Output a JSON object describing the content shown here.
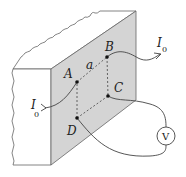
{
  "diagram": {
    "colors": {
      "face": "#d4d4d4",
      "line": "#555555",
      "background": "#ffffff"
    },
    "points": [
      {
        "label": "A",
        "x": 77,
        "y": 82
      },
      {
        "label": "B",
        "x": 107,
        "y": 57
      },
      {
        "label": "C",
        "x": 108,
        "y": 96
      },
      {
        "label": "D",
        "x": 77,
        "y": 118
      }
    ],
    "side_label": "a",
    "current_in": {
      "symbol": "I",
      "subscript": "0"
    },
    "current_out": {
      "symbol": "I",
      "subscript": "0"
    },
    "voltmeter": {
      "label": "V"
    }
  }
}
